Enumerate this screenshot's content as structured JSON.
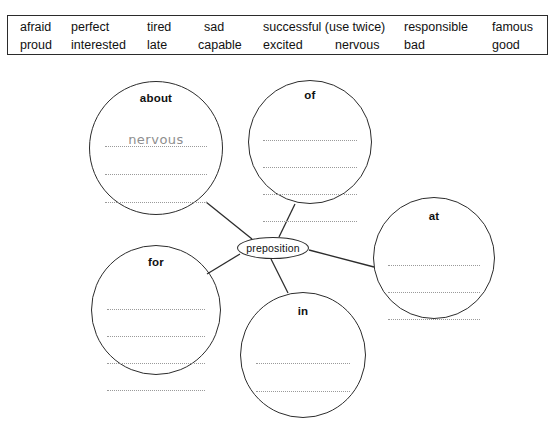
{
  "worksheet": {
    "word_bank": {
      "rows": [
        [
          {
            "text": "afraid",
            "x": 12
          },
          {
            "text": "perfect",
            "x": 63
          },
          {
            "text": "tired",
            "x": 139
          },
          {
            "text": "sad",
            "x": 196
          },
          {
            "text": "successful (use twice)",
            "x": 255
          },
          {
            "text": "responsible",
            "x": 396
          },
          {
            "text": "famous",
            "x": 484
          }
        ],
        [
          {
            "text": "proud",
            "x": 12
          },
          {
            "text": "interested",
            "x": 63
          },
          {
            "text": "late",
            "x": 139
          },
          {
            "text": "capable",
            "x": 190
          },
          {
            "text": "excited",
            "x": 255
          },
          {
            "text": "nervous",
            "x": 327
          },
          {
            "text": "bad",
            "x": 396
          },
          {
            "text": "good",
            "x": 484
          }
        ]
      ]
    },
    "mind_map": {
      "center": {
        "label": "preposition",
        "cx": 273,
        "cy": 190,
        "rx": 36,
        "ry": 11
      },
      "nodes": [
        {
          "id": "about",
          "label": "about",
          "cx": 156,
          "cy": 90,
          "r": 67,
          "label_top": 10,
          "lines_top": 36,
          "line_width": 102,
          "line_gap": 28,
          "line_count": 3,
          "answers": [
            "nervous",
            "",
            ""
          ]
        },
        {
          "id": "of",
          "label": "of",
          "cx": 310,
          "cy": 84,
          "r": 62,
          "label_top": 8,
          "lines_top": 32,
          "line_width": 94,
          "line_gap": 27,
          "line_count": 4,
          "answers": [
            "",
            "",
            "",
            ""
          ]
        },
        {
          "id": "at",
          "label": "at",
          "cx": 434,
          "cy": 200,
          "r": 61,
          "label_top": 12,
          "lines_top": 40,
          "line_width": 92,
          "line_gap": 27,
          "line_count": 3,
          "answers": [
            "",
            "",
            ""
          ]
        },
        {
          "id": "for",
          "label": "for",
          "cx": 156,
          "cy": 252,
          "r": 65,
          "label_top": 10,
          "lines_top": 36,
          "line_width": 98,
          "line_gap": 27,
          "line_count": 4,
          "answers": [
            "",
            "",
            "",
            ""
          ]
        },
        {
          "id": "in",
          "label": "in",
          "cx": 303,
          "cy": 297,
          "r": 63,
          "label_top": 12,
          "lines_top": 42,
          "line_width": 94,
          "line_gap": 28,
          "line_count": 2,
          "answers": [
            "",
            ""
          ]
        }
      ],
      "connectors": [
        {
          "from": "center",
          "to": "about",
          "x1": 252,
          "y1": 181,
          "x2": 206,
          "y2": 144
        },
        {
          "from": "center",
          "to": "of",
          "x1": 279,
          "y1": 179,
          "x2": 295,
          "y2": 146
        },
        {
          "from": "center",
          "to": "at",
          "x1": 309,
          "y1": 192,
          "x2": 374,
          "y2": 209
        },
        {
          "from": "center",
          "to": "for",
          "x1": 240,
          "y1": 196,
          "x2": 207,
          "y2": 216
        },
        {
          "from": "center",
          "to": "in",
          "x1": 271,
          "y1": 201,
          "x2": 288,
          "y2": 235
        }
      ]
    }
  },
  "colors": {
    "ink": "#2c2c2c",
    "dotted_rule": "#9a9a9a",
    "handwriting": "#8e8e8e",
    "box_border": "#2b2b2b"
  }
}
